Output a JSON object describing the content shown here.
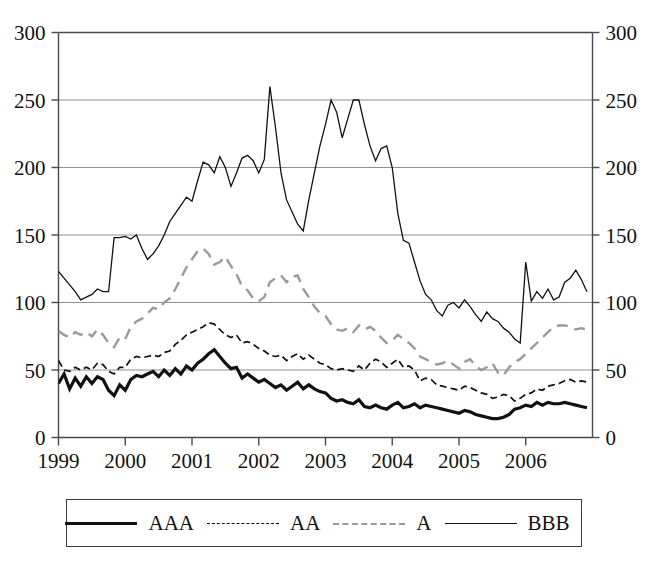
{
  "chart_data": {
    "type": "line",
    "title": "",
    "subtitle": "",
    "xlabel": "",
    "ylabel": "",
    "xlim": [
      1999.0,
      2007.0
    ],
    "ylim": [
      0,
      300
    ],
    "grid": true,
    "grid_axis": "y",
    "legend_position": "bottom",
    "dual_y_axis": true,
    "y_ticks": [
      0,
      50,
      100,
      150,
      200,
      250,
      300
    ],
    "y_tick_labels_left": [
      "0",
      "50",
      "100",
      "150",
      "200",
      "250",
      "300"
    ],
    "y_tick_labels_right": [
      "0",
      "50",
      "100",
      "150",
      "200",
      "250",
      "300"
    ],
    "x_ticks": [
      1999,
      2000,
      2001,
      2002,
      2003,
      2004,
      2005,
      2006
    ],
    "x_tick_labels": [
      "1999",
      "2000",
      "2001",
      "2002",
      "2003",
      "2004",
      "2005",
      "2006"
    ],
    "x_start": 1999.0,
    "x_step_months": 1,
    "series": [
      {
        "name": "AAA",
        "style": "solid",
        "color": "#111111",
        "width": 3.2,
        "values": [
          40,
          47,
          36,
          44,
          38,
          45,
          40,
          45,
          43,
          35,
          31,
          39,
          35,
          43,
          46,
          45,
          47,
          49,
          45,
          50,
          46,
          51,
          47,
          53,
          50,
          55,
          58,
          62,
          65,
          60,
          55,
          51,
          52,
          44,
          47,
          44,
          41,
          43,
          40,
          37,
          39,
          35,
          38,
          41,
          36,
          39,
          36,
          34,
          33,
          29,
          27,
          28,
          26,
          25,
          28,
          23,
          22,
          24,
          22,
          21,
          24,
          26,
          22,
          23,
          25,
          22,
          24,
          23,
          22,
          21,
          20,
          19,
          18,
          20,
          19,
          17,
          16,
          15,
          14,
          14,
          15,
          17,
          21,
          22,
          24,
          23,
          26,
          24,
          26,
          25,
          25,
          26,
          25,
          24,
          23,
          22
        ]
      },
      {
        "name": "AA",
        "style": "dashed-fine",
        "color": "#111111",
        "width": 1.7,
        "values": [
          57,
          50,
          49,
          52,
          50,
          52,
          50,
          55,
          54,
          49,
          47,
          52,
          52,
          58,
          60,
          59,
          60,
          61,
          60,
          63,
          64,
          69,
          72,
          76,
          78,
          80,
          82,
          85,
          84,
          80,
          76,
          74,
          76,
          70,
          71,
          69,
          66,
          64,
          61,
          60,
          61,
          57,
          60,
          62,
          58,
          61,
          58,
          55,
          54,
          51,
          50,
          51,
          50,
          49,
          53,
          50,
          55,
          58,
          56,
          52,
          55,
          58,
          52,
          53,
          50,
          42,
          44,
          43,
          39,
          38,
          37,
          36,
          35,
          38,
          37,
          35,
          33,
          32,
          29,
          30,
          32,
          31,
          27,
          29,
          32,
          33,
          36,
          35,
          38,
          39,
          40,
          42,
          43,
          41,
          42,
          41
        ]
      },
      {
        "name": "A",
        "style": "dashed-long",
        "color": "#9a9a9a",
        "width": 2.4,
        "values": [
          79,
          76,
          74,
          78,
          76,
          78,
          75,
          80,
          76,
          70,
          67,
          74,
          73,
          82,
          86,
          88,
          92,
          96,
          95,
          100,
          103,
          110,
          118,
          126,
          132,
          138,
          140,
          136,
          128,
          130,
          134,
          127,
          121,
          112,
          109,
          103,
          101,
          104,
          115,
          118,
          120,
          115,
          119,
          120,
          110,
          104,
          97,
          92,
          90,
          84,
          80,
          79,
          81,
          78,
          83,
          80,
          82,
          79,
          74,
          70,
          72,
          76,
          73,
          70,
          66,
          60,
          58,
          56,
          54,
          55,
          57,
          54,
          51,
          56,
          58,
          53,
          50,
          52,
          55,
          48,
          46,
          52,
          56,
          58,
          62,
          66,
          70,
          74,
          78,
          82,
          83,
          83,
          82,
          80,
          81,
          80
        ]
      },
      {
        "name": "BBB",
        "style": "solid-thin",
        "color": "#111111",
        "width": 1.3,
        "values": [
          123,
          118,
          113,
          108,
          102,
          104,
          106,
          110,
          108,
          108,
          148,
          148,
          149,
          147,
          150,
          140,
          132,
          136,
          142,
          150,
          160,
          166,
          172,
          178,
          175,
          190,
          204,
          202,
          196,
          208,
          200,
          186,
          196,
          207,
          209,
          205,
          196,
          206,
          260,
          230,
          196,
          176,
          167,
          158,
          153,
          176,
          196,
          216,
          232,
          250,
          241,
          222,
          236,
          250,
          250,
          232,
          216,
          205,
          214,
          216,
          200,
          166,
          146,
          144,
          130,
          116,
          106,
          102,
          94,
          90,
          98,
          100,
          96,
          102,
          97,
          91,
          86,
          93,
          88,
          86,
          81,
          78,
          73,
          70,
          130,
          101,
          108,
          103,
          110,
          102,
          104,
          115,
          118,
          124,
          117,
          108
        ]
      }
    ],
    "legend": [
      {
        "label": "AAA",
        "style": "solid",
        "color": "#111111"
      },
      {
        "label": "AA",
        "style": "dashed-fine",
        "color": "#111111"
      },
      {
        "label": "A",
        "style": "dashed-long",
        "color": "#9a9a9a"
      },
      {
        "label": "BBB",
        "style": "solid-thin",
        "color": "#111111"
      }
    ]
  },
  "axes": {
    "left_ticks": [
      "300",
      "250",
      "200",
      "150",
      "100",
      "50",
      "0"
    ],
    "right_ticks": [
      "300",
      "250",
      "200",
      "150",
      "100",
      "50",
      "0"
    ],
    "x_ticks": [
      "1999",
      "2000",
      "2001",
      "2002",
      "2003",
      "2004",
      "2005",
      "2006"
    ]
  }
}
